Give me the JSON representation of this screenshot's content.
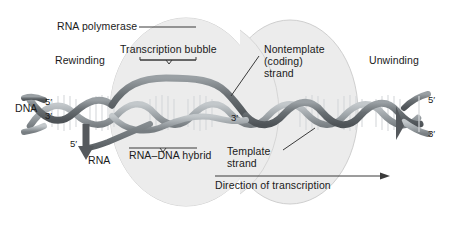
{
  "figure": {
    "background_color": "#ffffff",
    "enzyme_fill": "#eaeaea",
    "enzyme_stroke": "#c9c9c9",
    "strand_dark": "#5f6468",
    "strand_mid": "#8b9094",
    "strand_light": "#b9bec2",
    "rung_color": "#d8dadb",
    "text_color": "#1a1a1a",
    "leader_color": "#3a3a3a"
  },
  "labels": {
    "rna_polymerase": "RNA polymerase",
    "rewinding": "Rewinding",
    "transcription_bubble": "Transcription bubble",
    "nontemplate_line1": "Nontemplate",
    "nontemplate_line2": "(coding)",
    "nontemplate_line3": "strand",
    "unwinding": "Unwinding",
    "dna": "DNA",
    "rna": "RNA",
    "rna_dna_hybrid": "RNA–DNA hybrid",
    "template_line1": "Template",
    "template_line2": "strand",
    "direction_of_transcription": "Direction of transcription"
  },
  "prime_marks": {
    "dna_left_top": "5′",
    "dna_left_bottom": "3′",
    "rna_five_prime": "5′",
    "template_three_prime": "3′",
    "dna_right_top": "5′",
    "dna_right_bottom": "3′"
  },
  "annotations": {
    "bracket_transcription_bubble": "bracket under Transcription bubble label",
    "bracket_rna_dna_hybrid": "bracket above RNA-DNA hybrid label",
    "arrow_direction": "rightward arrow above Direction of transcription label",
    "leader_rna_polymerase": "horizontal leader from RNA polymerase label to enzyme body",
    "leader_nontemplate": "diagonal leader from Nontemplate label to upper DNA strand",
    "leader_template": "diagonal leader from Template strand label to lower DNA strand"
  }
}
